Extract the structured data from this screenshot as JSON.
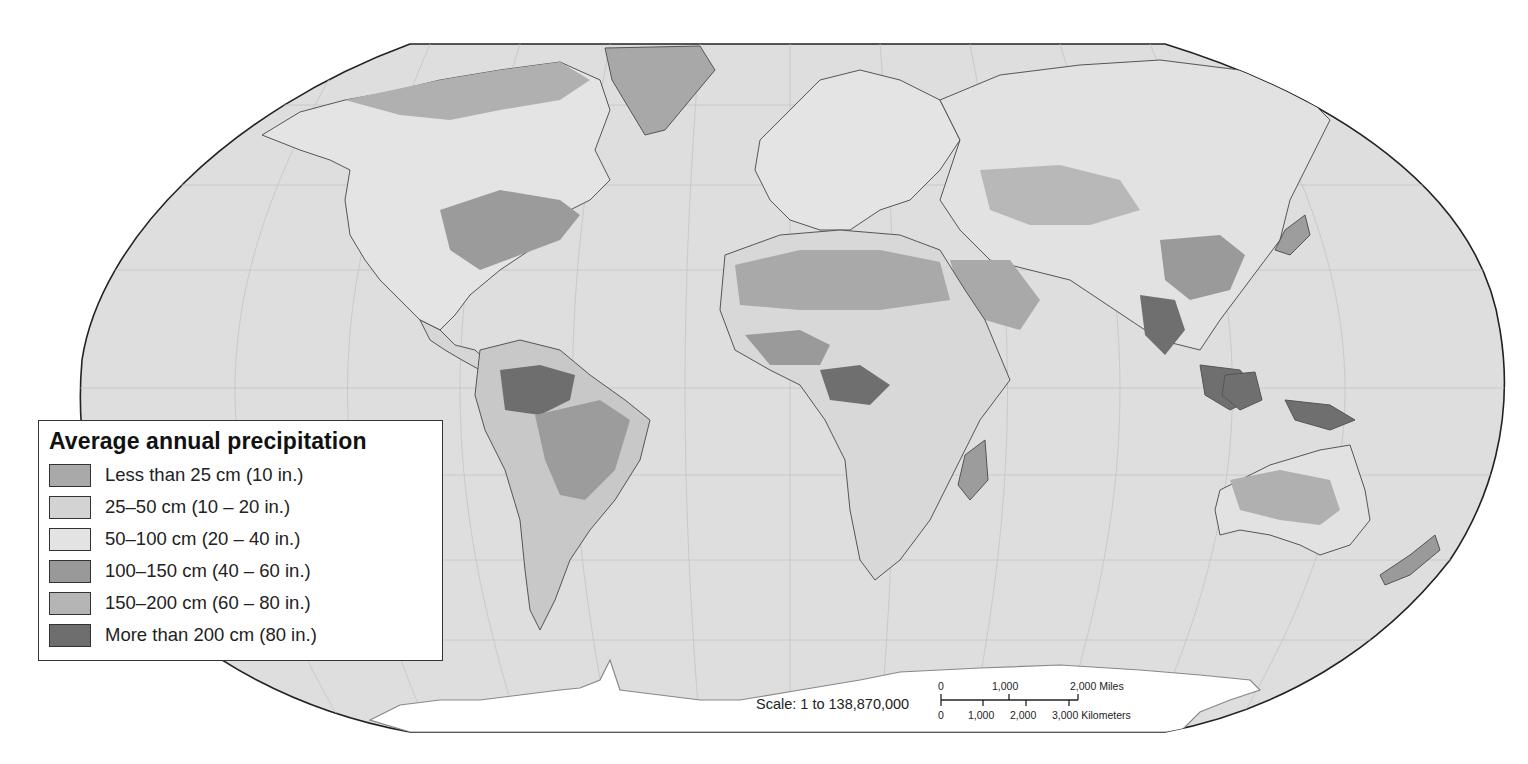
{
  "map": {
    "title": "Average annual precipitation",
    "projection": "Robinson-style world map",
    "ocean_color": "#dcdcdc",
    "land_base_color": "#e6e6e6",
    "border_color": "#555555"
  },
  "legend": {
    "title": "Average annual precipitation",
    "items": [
      {
        "label": "Less than 25 cm (10 in.)",
        "color": "#a9a9a9"
      },
      {
        "label": "25–50 cm (10 – 20 in.)",
        "color": "#d3d3d3"
      },
      {
        "label": "50–100 cm (20 – 40 in.)",
        "color": "#e3e3e3"
      },
      {
        "label": "100–150 cm (40 – 60 in.)",
        "color": "#999999"
      },
      {
        "label": "150–200 cm (60 – 80 in.)",
        "color": "#b5b5b5"
      },
      {
        "label": "More than 200 cm (80 in.)",
        "color": "#6e6e6e"
      }
    ]
  },
  "scale": {
    "label": "Scale:  1 to 138,870,000",
    "miles_ticks": [
      "0",
      "1,000",
      "2,000 Miles"
    ],
    "km_ticks": [
      "0",
      "1,000",
      "2,000",
      "3,000 Kilometers"
    ]
  }
}
